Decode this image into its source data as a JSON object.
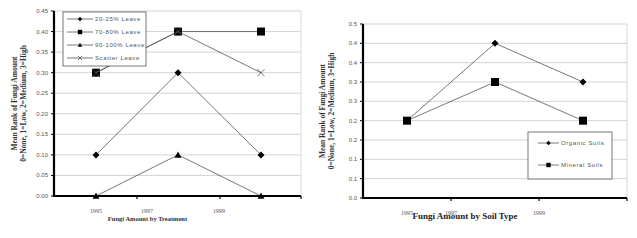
{
  "chart_data": [
    {
      "type": "line",
      "title": "Fungi Amount by Treatment",
      "xlabel": "Fungi Amount by Treatment",
      "ylabel": "Mean Rank of Fungi Amount",
      "ylabel2": "0=None, 1=Low, 2=Medium, 3=High",
      "x_tick_labels": [
        "1995",
        "1997",
        "1999"
      ],
      "x": [
        1995,
        1998,
        2000
      ],
      "y_tick_labels": [
        "0.45",
        "0.40",
        "0.35",
        "0.30",
        "0.25",
        "0.20",
        "0.15",
        "0.10",
        "0.05",
        "0.00"
      ],
      "ylim": [
        0,
        0.45
      ],
      "grid": true,
      "legend_position": "upper-left-inside",
      "series": [
        {
          "name": "20-25% Leave",
          "marker": "diamond",
          "values": [
            0.1,
            0.3,
            0.1
          ]
        },
        {
          "name": "70-80% Leave",
          "marker": "square",
          "values": [
            0.3,
            0.4,
            0.4
          ]
        },
        {
          "name": "90-100% Leave",
          "marker": "triangle",
          "values": [
            0.0,
            0.1,
            0.0
          ]
        },
        {
          "name": "Scatter Leave",
          "marker": "x",
          "values": [
            0.3,
            0.4,
            0.3
          ]
        }
      ]
    },
    {
      "type": "line",
      "title": "Fungi Amount by Soil Type",
      "xlabel": "Fungi Amount by Soil Type",
      "ylabel": "Mean Rank of Fungi Amount",
      "ylabel2": "0=None, 1=Low, 2=Medium, 3=High",
      "x_tick_labels": [
        "1995",
        "1997",
        "1999"
      ],
      "x": [
        1995,
        1998,
        2000
      ],
      "y_tick_labels": [
        "0.5",
        "0.4",
        "0.4",
        "0.3",
        "0.3",
        "0.2",
        "0.2",
        "0.1",
        "0.1",
        "0.0"
      ],
      "ylim": [
        0,
        0.45
      ],
      "grid": true,
      "legend_position": "lower-right-inside",
      "series": [
        {
          "name": "Organic Soils",
          "marker": "diamond",
          "values": [
            0.2,
            0.4,
            0.3
          ]
        },
        {
          "name": "Mineral Soils",
          "marker": "square",
          "values": [
            0.2,
            0.3,
            0.2
          ]
        }
      ]
    }
  ]
}
